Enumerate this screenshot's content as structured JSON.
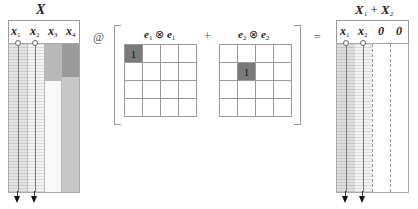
{
  "left_matrix": {
    "title": "X",
    "columns": [
      {
        "name": "x",
        "sub": "1"
      },
      {
        "name": "x",
        "sub": "2"
      },
      {
        "name": "x",
        "sub": "3"
      },
      {
        "name": "x",
        "sub": "4"
      }
    ],
    "column_shades": [
      "#e2e2e2",
      "#f2f2f2",
      "#c8c8c8",
      "#a5a5a5"
    ]
  },
  "operator_at": "@",
  "kron_terms": [
    {
      "a": "e",
      "a_sub": "1",
      "op": "⊗",
      "b": "e",
      "b_sub": "1",
      "cells": [
        [
          1,
          0,
          0,
          0
        ],
        [
          0,
          0,
          0,
          0
        ],
        [
          0,
          0,
          0,
          0
        ],
        [
          0,
          0,
          0,
          0
        ]
      ],
      "one_label": "1"
    },
    {
      "a": "e",
      "a_sub": "2",
      "op": "⊗",
      "b": "e",
      "b_sub": "2",
      "cells": [
        [
          0,
          0,
          0,
          0
        ],
        [
          0,
          1,
          0,
          0
        ],
        [
          0,
          0,
          0,
          0
        ],
        [
          0,
          0,
          0,
          0
        ]
      ],
      "one_label": "1"
    }
  ],
  "operator_plus": "+",
  "operator_equals": "=",
  "right_matrix": {
    "title": {
      "a": "X",
      "a_sub": "1",
      "plus": "+",
      "b": "X",
      "b_sub": "2"
    },
    "columns": [
      {
        "name": "x",
        "sub": "1"
      },
      {
        "name": "x",
        "sub": "2"
      },
      {
        "name": "0",
        "sub": ""
      },
      {
        "name": "0",
        "sub": ""
      }
    ]
  }
}
